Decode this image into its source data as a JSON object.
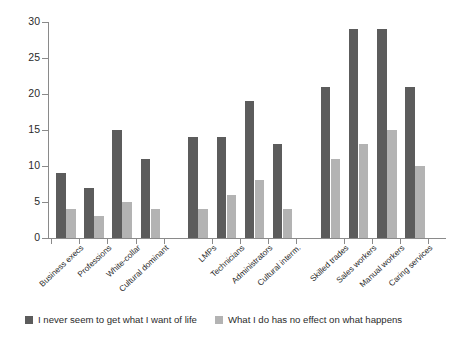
{
  "chart_data": {
    "type": "bar",
    "title": "",
    "xlabel": "",
    "ylabel": "",
    "ylim": [
      0,
      30
    ],
    "ytick_values": [
      0,
      5,
      10,
      15,
      20,
      25,
      30
    ],
    "ytick_labels": [
      "0",
      "5",
      "10",
      "15",
      "20",
      "25",
      "30"
    ],
    "grid": false,
    "legend_position": "bottom",
    "group_gap": true,
    "categories": [
      "Business execs",
      "Professions",
      "White-collar",
      "Cultural dominant",
      "LMPs",
      "Technicians",
      "Administrators",
      "Cultural interm.",
      "Skilled trades",
      "Sales workers",
      "Manual workers",
      "Caring services"
    ],
    "groups": [
      {
        "name": "dominant",
        "categories": [
          "Business execs",
          "Professions",
          "White-collar",
          "Cultural dominant"
        ]
      },
      {
        "name": "intermediate",
        "categories": [
          "LMPs",
          "Technicians",
          "Administrators",
          "Cultural interm."
        ]
      },
      {
        "name": "working",
        "categories": [
          "Skilled trades",
          "Sales workers",
          "Manual workers",
          "Caring services"
        ]
      }
    ],
    "series": [
      {
        "name": "I never seem to get what I want of life",
        "color": "#5c5c5c",
        "values": [
          9,
          7,
          15,
          11,
          14,
          14,
          19,
          13,
          21,
          29,
          29,
          21
        ]
      },
      {
        "name": "What I do has no effect on what happens",
        "color": "#b3b3b3",
        "values": [
          4,
          3,
          5,
          4,
          4,
          6,
          8,
          4,
          11,
          13,
          15,
          10
        ]
      }
    ]
  },
  "legend": {
    "items": [
      {
        "label": "I never seem to get what I want of life",
        "color": "#5c5c5c"
      },
      {
        "label": "What I do has no effect on what happens",
        "color": "#b3b3b3"
      }
    ]
  },
  "colors": {
    "series_dark": "#5c5c5c",
    "series_light": "#b3b3b3",
    "axis": "#8a8a8a",
    "text": "#2b2b2b",
    "background": "#ffffff"
  }
}
